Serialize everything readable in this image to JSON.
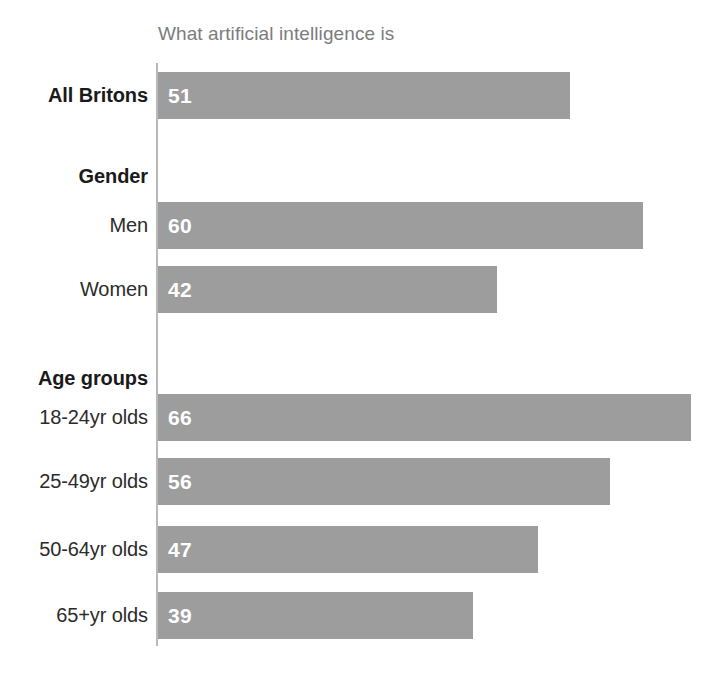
{
  "chart_data": {
    "type": "bar",
    "orientation": "horizontal",
    "title": "What artificial intelligence is",
    "xlabel": "",
    "ylabel": "",
    "xlim": [
      0,
      70
    ],
    "grid": false,
    "legend": null,
    "value_labels_inside_bars": true,
    "bar_color": "#9d9d9d",
    "value_label_color": "#ffffff",
    "axis_line_color": "#b9b9b9",
    "title_color": "#7c7c7c",
    "label_color": "#2b2b2b",
    "categories": [
      "All Britons",
      "Men",
      "Women",
      "18-24yr olds",
      "25-49yr olds",
      "50-64yr olds",
      "65+yr olds"
    ],
    "values": [
      51,
      60,
      42,
      66,
      56,
      47,
      39
    ],
    "group_headings": [
      "Gender",
      "Age groups"
    ],
    "rows": [
      {
        "kind": "bar",
        "label": "All Britons",
        "value": 51,
        "bold": true,
        "top": 72,
        "value_text": "51"
      },
      {
        "kind": "group",
        "label": "Gender",
        "value": null,
        "bold": true,
        "top": 156,
        "value_text": ""
      },
      {
        "kind": "bar",
        "label": "Men",
        "value": 60,
        "bold": false,
        "top": 202,
        "value_text": "60"
      },
      {
        "kind": "bar",
        "label": "Women",
        "value": 42,
        "bold": false,
        "top": 266,
        "value_text": "42"
      },
      {
        "kind": "group",
        "label": "Age groups",
        "value": null,
        "bold": true,
        "top": 358,
        "value_text": ""
      },
      {
        "kind": "bar",
        "label": "18-24yr olds",
        "value": 66,
        "bold": false,
        "top": 394,
        "value_text": "66"
      },
      {
        "kind": "bar",
        "label": "25-49yr olds",
        "value": 56,
        "bold": false,
        "top": 458,
        "value_text": "56"
      },
      {
        "kind": "bar",
        "label": "50-64yr olds",
        "value": 47,
        "bold": false,
        "top": 526,
        "value_text": "47"
      },
      {
        "kind": "bar",
        "label": "65+yr olds",
        "value": 39,
        "bold": false,
        "top": 592,
        "value_text": "39"
      }
    ],
    "scale_px_per_unit": 8.08,
    "bar_origin_x": 158
  }
}
